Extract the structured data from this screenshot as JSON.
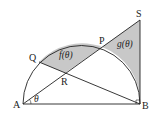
{
  "diagram": {
    "points": {
      "A": {
        "label": "A",
        "x": 23,
        "y": 104
      },
      "B": {
        "label": "B",
        "x": 140,
        "y": 104
      },
      "S": {
        "label": "S",
        "x": 140,
        "y": 20
      },
      "P": {
        "label": "P",
        "x": 102,
        "y": 47
      },
      "Q": {
        "label": "Q",
        "x": 39,
        "y": 62
      },
      "R": {
        "label": "R",
        "x": 65,
        "y": 73
      }
    },
    "regions": {
      "f": "f(θ)",
      "g": "g(θ)"
    },
    "angle_label": "θ",
    "colors": {
      "stroke": "#222222",
      "shade": "#c8c8c8",
      "background": "#ffffff"
    }
  }
}
